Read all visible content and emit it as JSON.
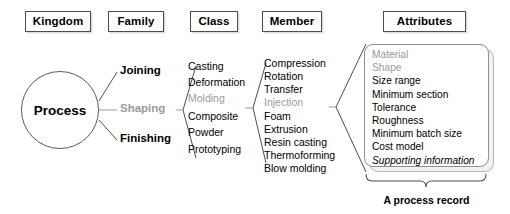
{
  "diagram": {
    "colors": {
      "text": "#000000",
      "highlight": "#9a9a9a",
      "box_border": "#4d4d4d",
      "line": "#4d4d4d",
      "panel_border": "#8f8f8f",
      "background": "#ffffff"
    },
    "headers": [
      {
        "label": "Kingdom",
        "x": 25,
        "y": 11,
        "w": 66
      },
      {
        "label": "Family",
        "x": 108,
        "y": 11,
        "w": 56
      },
      {
        "label": "Class",
        "x": 190,
        "y": 11,
        "w": 48
      },
      {
        "label": "Member",
        "x": 262,
        "y": 11,
        "w": 60
      },
      {
        "label": "Attributes",
        "x": 383,
        "y": 11,
        "w": 83
      }
    ],
    "kingdom": {
      "label": "Process",
      "shape": "circle"
    },
    "family": [
      {
        "label": "Joining",
        "highlighted": false
      },
      {
        "label": "Shaping",
        "highlighted": true
      },
      {
        "label": "Finishing",
        "highlighted": false
      }
    ],
    "class_items": [
      {
        "label": "Casting",
        "highlighted": false
      },
      {
        "label": "Deformation",
        "highlighted": false
      },
      {
        "label": "Molding",
        "highlighted": true
      },
      {
        "label": "Composite",
        "highlighted": false
      },
      {
        "label": "Powder",
        "highlighted": false
      },
      {
        "label": "Prototyping",
        "highlighted": false
      }
    ],
    "member_items": [
      {
        "label": "Compression",
        "highlighted": false
      },
      {
        "label": "Rotation",
        "highlighted": false
      },
      {
        "label": "Transfer",
        "highlighted": false
      },
      {
        "label": "Injection",
        "highlighted": true
      },
      {
        "label": "Foam",
        "highlighted": false
      },
      {
        "label": "Extrusion",
        "highlighted": false
      },
      {
        "label": "Resin casting",
        "highlighted": false
      },
      {
        "label": "Thermoforming",
        "highlighted": false
      },
      {
        "label": "Blow molding",
        "highlighted": false
      }
    ],
    "attributes": [
      {
        "label": "Material",
        "highlighted": true,
        "italic": false
      },
      {
        "label": "Shape",
        "highlighted": true,
        "italic": false
      },
      {
        "label": "Size range",
        "highlighted": false,
        "italic": false
      },
      {
        "label": "Minimum section",
        "highlighted": false,
        "italic": false
      },
      {
        "label": "Tolerance",
        "highlighted": false,
        "italic": false
      },
      {
        "label": "Roughness",
        "highlighted": false,
        "italic": false
      },
      {
        "label": "Minimum batch size",
        "highlighted": false,
        "italic": false
      },
      {
        "label": "Cost model",
        "highlighted": false,
        "italic": false
      },
      {
        "label": "Supporting information",
        "highlighted": false,
        "italic": true
      }
    ],
    "record_caption": "A process record"
  }
}
